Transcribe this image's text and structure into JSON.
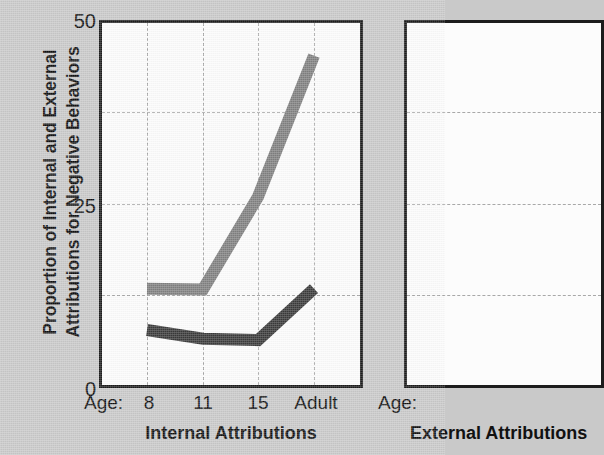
{
  "figure": {
    "background_color": "#c9c9c9",
    "panel_background": "#fcfcfc",
    "axis_color": "#1c1c1c",
    "grid_color": "#a8a8a8"
  },
  "y_axis": {
    "label_line1": "Proportion of Internal and External",
    "label_line2": "Attributions for Negative Behaviors",
    "ticks": [
      "50",
      "25",
      "0"
    ],
    "min": 0,
    "max": 50
  },
  "panels": [
    {
      "name": "internal",
      "title": "Internal Attributions",
      "x_prefix": "Age:",
      "x_ticks": [
        "8",
        "11",
        "15",
        "Adult"
      ]
    },
    {
      "name": "external",
      "title": "External Attributions",
      "x_prefix": "Age:",
      "x_ticks": [
        "8",
        "11",
        "15",
        "Adult"
      ]
    }
  ],
  "chart_data": {
    "type": "line",
    "title": "Internal Attributions",
    "xlabel": "Age:",
    "ylabel": "Proportion of Internal and External Attributions for Negative Behaviors",
    "categories": [
      "8",
      "11",
      "15",
      "Adult"
    ],
    "ylim": [
      0,
      50
    ],
    "yticks": [
      0,
      25,
      50
    ],
    "grid": true,
    "grid_y_values": [
      12.5,
      25,
      37.5
    ],
    "legend": "none",
    "series": [
      {
        "name": "light-gray-series",
        "color": "#808080",
        "values": [
          13.3,
          13.2,
          26.0,
          45.5
        ]
      },
      {
        "name": "dark-gray-series",
        "color": "#3a3a3a",
        "values": [
          7.6,
          6.4,
          6.2,
          13.3
        ]
      }
    ]
  }
}
